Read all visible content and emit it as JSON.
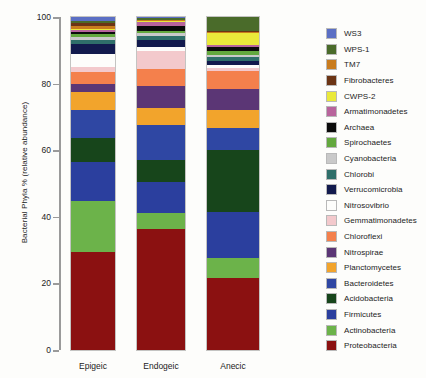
{
  "chart_data": {
    "type": "bar",
    "title": "",
    "xlabel": "",
    "ylabel": "Bacterial Phyla % (relative abundance)",
    "ylim": [
      0,
      100
    ],
    "ytick_labels": [
      "0",
      "20",
      "40",
      "60",
      "80",
      "100"
    ],
    "yticks": [
      0,
      20,
      40,
      60,
      80,
      100
    ],
    "grid": false,
    "stacked": true,
    "legend_position": "right",
    "categories": [
      "Epigeic",
      "Endogeic",
      "Anecic"
    ],
    "series": [
      {
        "name": "Proteobacteria",
        "color": "#8b1111",
        "values": [
          31.5,
          38.5,
          21.5
        ]
      },
      {
        "name": "Actinobacteria",
        "color": "#6cb34a",
        "values": [
          16.5,
          5.0,
          6.0
        ]
      },
      {
        "name": "Firmicutes",
        "color": "#2b3f9e",
        "values": [
          12.5,
          10.0,
          13.5
        ]
      },
      {
        "name": "Acidobacteria",
        "color": "#17451b",
        "values": [
          7.5,
          7.0,
          18.5
        ]
      },
      {
        "name": "Bacteroidetes",
        "color": "#2f47a3",
        "values": [
          9.0,
          11.0,
          6.5
        ]
      },
      {
        "name": "Planctomycetes",
        "color": "#f2a42c",
        "values": [
          6.0,
          5.5,
          5.5
        ]
      },
      {
        "name": "Nitrospirae",
        "color": "#5b3675",
        "values": [
          2.5,
          7.0,
          6.0
        ]
      },
      {
        "name": "Chloroflexi",
        "color": "#f4804c",
        "values": [
          4.0,
          5.5,
          5.5
        ]
      },
      {
        "name": "Gemmatimonadetes",
        "color": "#f3c9cc",
        "values": [
          1.5,
          5.5,
          1.0
        ]
      },
      {
        "name": "Nitrosovibrio",
        "color": "#fdfdfb",
        "values": [
          4.0,
          1.5,
          0.8
        ]
      },
      {
        "name": "Verrucomicrobia",
        "color": "#121a4d",
        "values": [
          3.5,
          2.0,
          1.0
        ]
      },
      {
        "name": "Chlorobi",
        "color": "#2f6f6a",
        "values": [
          1.0,
          1.5,
          1.2
        ]
      },
      {
        "name": "Cyanobacteria",
        "color": "#c9c9c9",
        "values": [
          1.0,
          1.0,
          0.8
        ]
      },
      {
        "name": "Spirochaetes",
        "color": "#63a83e",
        "values": [
          1.0,
          0.6,
          1.2
        ]
      },
      {
        "name": "Archaea",
        "color": "#0b0b0b",
        "values": [
          0.7,
          1.5,
          1.0
        ]
      },
      {
        "name": "Armatimonadetes",
        "color": "#b8649c",
        "values": [
          0.6,
          1.2,
          0.8
        ]
      },
      {
        "name": "CWPS-2",
        "color": "#eae93a",
        "values": [
          0.5,
          0.3,
          3.5
        ]
      },
      {
        "name": "TM7",
        "color": "#c97c1e",
        "values": [
          0.9,
          0.3,
          0.4
        ]
      },
      {
        "name": "Fibrobacteres",
        "color": "#6b3414",
        "values": [
          0.9,
          0.2,
          0.3
        ]
      },
      {
        "name": "WPS-1",
        "color": "#4a6b2a",
        "values": [
          0.6,
          0.4,
          4.0
        ]
      },
      {
        "name": "WS3",
        "color": "#5b6fc4",
        "values": [
          1.3,
          0.4,
          0.0
        ]
      }
    ],
    "legend_entries": [
      {
        "label": "WS3",
        "color": "#5b6fc4"
      },
      {
        "label": "WPS-1",
        "color": "#4a6b2a"
      },
      {
        "label": "TM7",
        "color": "#c97c1e"
      },
      {
        "label": "Fibrobacteres",
        "color": "#6b3414"
      },
      {
        "label": "CWPS-2",
        "color": "#eae93a"
      },
      {
        "label": "Armatimonadetes",
        "color": "#b8649c"
      },
      {
        "label": "Archaea",
        "color": "#0b0b0b"
      },
      {
        "label": "Spirochaetes",
        "color": "#63a83e"
      },
      {
        "label": "Cyanobacteria",
        "color": "#c9c9c9"
      },
      {
        "label": "Chlorobi",
        "color": "#2f6f6a"
      },
      {
        "label": "Verrucomicrobia",
        "color": "#121a4d"
      },
      {
        "label": "Nitrosovibrio",
        "color": "#fdfdfb"
      },
      {
        "label": "Gemmatimonadetes",
        "color": "#f3c9cc"
      },
      {
        "label": "Chloroflexi",
        "color": "#f4804c"
      },
      {
        "label": "Nitrospirae",
        "color": "#5b3675"
      },
      {
        "label": "Planctomycetes",
        "color": "#f2a42c"
      },
      {
        "label": "Bacteroidetes",
        "color": "#2f47a3"
      },
      {
        "label": "Acidobacteria",
        "color": "#17451b"
      },
      {
        "label": "Firmicutes",
        "color": "#2b3f9e"
      },
      {
        "label": "Actinobacteria",
        "color": "#6cb34a"
      },
      {
        "label": "Proteobacteria",
        "color": "#8b1111"
      }
    ]
  }
}
